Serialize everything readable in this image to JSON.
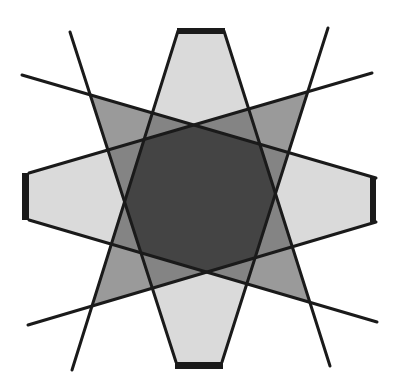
{
  "figure": {
    "title": "",
    "colors": {
      "background": "#ffffff",
      "hexagon_fill": "#dadada",
      "diagonal_fill": "#9a9a9a",
      "line": "#1a1a1a",
      "bar": "#1a1a1a"
    },
    "shapes": [
      {
        "name": "horizontal-hexagon",
        "kind": "hexagon",
        "points": "29,173 196,125 376,178 376,222 207,272 29,220"
      },
      {
        "name": "vertical-hexagon",
        "kind": "hexagon",
        "points": "178,31 224,31 275,194 222,362 176,362 125,202"
      },
      {
        "name": "diagonal-nw-se",
        "kind": "diagonal",
        "points": "89,94 260,144 310,302 141,253"
      },
      {
        "name": "diagonal-ne-sw",
        "kind": "diagonal",
        "points": "309,91 255,258 92,306 144,140"
      }
    ],
    "lines": [
      {
        "x1": 22,
        "y1": 75,
        "x2": 376,
        "y2": 178
      },
      {
        "x1": 372,
        "y1": 73,
        "x2": 29,
        "y2": 173
      },
      {
        "x1": 28,
        "y1": 325,
        "x2": 376,
        "y2": 222
      },
      {
        "x1": 377,
        "y1": 322,
        "x2": 29,
        "y2": 220
      },
      {
        "x1": 70,
        "y1": 32,
        "x2": 176,
        "y2": 362
      },
      {
        "x1": 328,
        "y1": 28,
        "x2": 222,
        "y2": 362
      },
      {
        "x1": 178,
        "y1": 31,
        "x2": 72,
        "y2": 370
      },
      {
        "x1": 224,
        "y1": 31,
        "x2": 330,
        "y2": 366
      }
    ],
    "bars": [
      {
        "name": "top-bar",
        "x": 177,
        "y": 28,
        "w": 48,
        "h": 6
      },
      {
        "name": "bottom-bar",
        "x": 175,
        "y": 362,
        "w": 48,
        "h": 7
      },
      {
        "name": "left-bar",
        "x": 22,
        "y": 173,
        "w": 7,
        "h": 47
      },
      {
        "name": "right-bar",
        "x": 370,
        "y": 178,
        "w": 6,
        "h": 44
      }
    ]
  }
}
